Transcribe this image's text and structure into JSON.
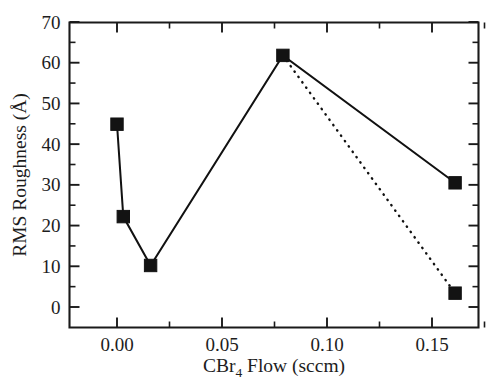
{
  "chart_data": {
    "type": "line",
    "title": "",
    "xlabel": "CBr4 Flow (sccm)",
    "xlabel_parts": {
      "pre": "CBr",
      "sub": "4",
      "post": " Flow (sccm)"
    },
    "ylabel": "RMS Roughness (Å)",
    "xlim": [
      -0.013,
      0.185
    ],
    "ylim": [
      0,
      70
    ],
    "xticks": [
      0.0,
      0.05,
      0.1,
      0.15
    ],
    "xtick_labels": [
      "0.00",
      "0.05",
      "0.10",
      "0.15"
    ],
    "xminor_ticks": [
      0.025,
      0.075,
      0.125,
      0.175
    ],
    "yticks": [
      0,
      10,
      20,
      30,
      40,
      50,
      60,
      70
    ],
    "ytick_labels": [
      "0",
      "10",
      "20",
      "30",
      "40",
      "50",
      "60",
      "70"
    ],
    "yminor_ticks": [
      5,
      15,
      25,
      35,
      45,
      55,
      65
    ],
    "grid": false,
    "legend": "none",
    "marker": "square",
    "marker_color": "#131313",
    "line_color": "#111111",
    "series": [
      {
        "name": "solid",
        "style": "solid",
        "x": [
          0.0,
          0.003,
          0.016,
          0.079,
          0.161
        ],
        "y": [
          44.9,
          22.2,
          10.2,
          61.8,
          30.5
        ]
      },
      {
        "name": "dotted",
        "style": "dotted",
        "x": [
          0.079,
          0.161
        ],
        "y": [
          61.8,
          3.4
        ]
      }
    ],
    "points": [
      {
        "x": 0.0,
        "y": 44.9
      },
      {
        "x": 0.003,
        "y": 22.2
      },
      {
        "x": 0.016,
        "y": 10.2
      },
      {
        "x": 0.079,
        "y": 61.8
      },
      {
        "x": 0.161,
        "y": 30.5
      },
      {
        "x": 0.161,
        "y": 3.4
      }
    ]
  },
  "figure": {
    "background": "#ffffff",
    "frame_color": "#1a1a1a"
  }
}
